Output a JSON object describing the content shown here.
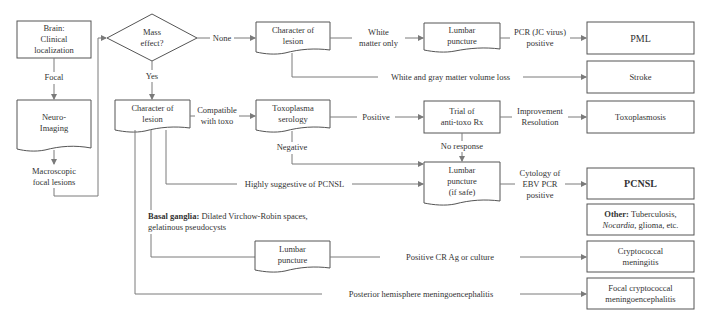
{
  "nodes": {
    "brain": "Brain:\nClinical\nlocalization",
    "neuro_imaging": "Neuro-\nImaging",
    "macroscopic": "Macroscopic\nfocal lesions",
    "mass_effect": "Mass\neffect?",
    "char_lesion_top": "Character of\nlesion",
    "lumbar_top": "Lumbar\npuncture",
    "pml": "PML",
    "stroke": "Stroke",
    "char_lesion_mid": "Character of\nlesion",
    "toxo_serology": "Toxoplasma\nserology",
    "trial_antitoxo": "Trial of\nanti-toxo Rx",
    "toxoplasmosis": "Toxoplasmosis",
    "lumbar_safe": "Lumbar\npuncture\n(if safe)",
    "pcnsl": "PCNSL",
    "other_bold": "Other:",
    "other_rest": " Tuberculosis,",
    "other_italic": "Nocardia",
    "other_tail": ", glioma, etc.",
    "lumbar_bottom": "Lumbar\npuncture",
    "cryptococcal": "Cryptococcal\nmeningitis",
    "focal_crypto": "Focal cryptococcal\nmeningoencephalitis"
  },
  "edge_labels": {
    "focal": "Focal",
    "none": "None",
    "yes": "Yes",
    "white_matter_only": "White\nmatter only",
    "pcr_jc": "PCR (JC virus)\npositive",
    "white_gray_loss": "White and gray matter volume loss",
    "compatible_toxo": "Compatible\nwith toxo",
    "positive": "Positive",
    "improvement": "Improvement\nResolution",
    "negative": "Negative",
    "no_response": "No response",
    "highly_suggestive": "Highly suggestive of PCNSL",
    "cytology_ebv": "Cytology of\nEBV PCR\npositive",
    "positive_crag": "Positive CR Ag or culture",
    "posterior_hemisphere": "Posterior hemisphere meningoencephalitis"
  },
  "notes": {
    "basal_bold": "Basal ganglia:",
    "basal_rest": " Dilated Virchow-Robin spaces,",
    "basal_line2": "gelatinous pseudocysts"
  },
  "colors": {
    "line": "#7a7a7a",
    "box_border": "#555555",
    "text": "#333333",
    "background": "#ffffff"
  }
}
